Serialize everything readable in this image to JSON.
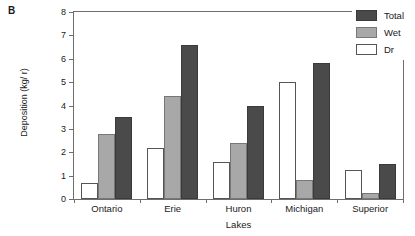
{
  "figure": {
    "panel_label": "B"
  },
  "chart_data": {
    "type": "bar",
    "title": "",
    "subtitle": "",
    "xlabel": "Lakes",
    "ylabel": "Deposition (kg/ r)",
    "categories": [
      "Ontario",
      "Erie",
      "Huron",
      "Michigan",
      "Superior"
    ],
    "series": [
      {
        "name": "Dr",
        "color": "#ffffff",
        "values": [
          0.7,
          2.2,
          1.6,
          5.0,
          1.25
        ]
      },
      {
        "name": "Wet",
        "color": "#a8a8a8",
        "values": [
          2.8,
          4.4,
          2.4,
          0.8,
          0.25
        ]
      },
      {
        "name": "Total",
        "color": "#4a4a4a",
        "values": [
          3.5,
          6.6,
          4.0,
          5.8,
          1.5
        ]
      }
    ],
    "ylim": [
      0,
      8
    ],
    "yticks": [
      0,
      1,
      2,
      3,
      4,
      5,
      6,
      7,
      8
    ],
    "ytick_labels": [
      "0",
      "1",
      "2",
      "3",
      "4",
      "5",
      "6",
      "7",
      "8"
    ],
    "grid": false,
    "legend_position": "top-right",
    "legend_order": [
      "Total",
      "Wet",
      "Dr"
    ],
    "bar_order_in_group": [
      "Dr",
      "Wet",
      "Total"
    ]
  },
  "legend": {
    "entries": [
      {
        "label": "Total",
        "color": "#4a4a4a",
        "icon": "swatch-icon"
      },
      {
        "label": "Wet",
        "color": "#a8a8a8",
        "icon": "swatch-icon"
      },
      {
        "label": "Dr",
        "color": "#ffffff",
        "icon": "swatch-icon"
      }
    ]
  }
}
